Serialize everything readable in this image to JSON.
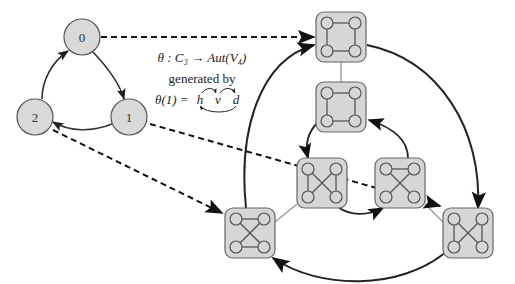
{
  "diagram": {
    "title_line1": "θ : C₃ → Aut(V₄)",
    "title_line2": "generated by",
    "title_line3_prefix": "θ(1) = ",
    "generator_letters": [
      "h",
      "v",
      "d"
    ],
    "colors": {
      "node_fill": "#d9d9d9",
      "node_stroke": "#555555",
      "box_fill": "#d6d6d6",
      "box_stroke": "#666666",
      "arrow": "#222222",
      "light_edge": "#9a9a9a"
    },
    "cycle_nodes": [
      {
        "id": "0",
        "label": "0",
        "x": 82,
        "y": 37
      },
      {
        "id": "1",
        "label": "1",
        "x": 129,
        "y": 117
      },
      {
        "id": "2",
        "label": "2",
        "x": 35,
        "y": 117
      }
    ],
    "automorphism_boxes": [
      {
        "id": "A",
        "x": 341,
        "y": 37,
        "edges": "square"
      },
      {
        "id": "B",
        "x": 341,
        "y": 107,
        "edges": "square"
      },
      {
        "id": "C",
        "x": 322,
        "y": 183,
        "edges": "left-vertical-cross"
      },
      {
        "id": "D",
        "x": 400,
        "y": 183,
        "edges": "top-horizontal-cross"
      },
      {
        "id": "E",
        "x": 250,
        "y": 233,
        "edges": "horizontal-cross"
      },
      {
        "id": "F",
        "x": 468,
        "y": 233,
        "edges": "vertical-cross"
      }
    ],
    "mapping_arrows": [
      {
        "from": "0",
        "to": "A",
        "style": "dashed"
      },
      {
        "from": "1",
        "to": "F",
        "style": "dashed"
      },
      {
        "from": "2",
        "to": "E",
        "style": "dashed"
      }
    ]
  }
}
